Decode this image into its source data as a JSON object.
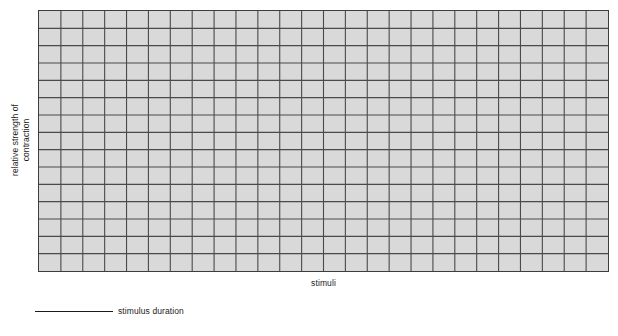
{
  "figure": {
    "title": "",
    "y_axis_label_line1": "relative strength of",
    "y_axis_label_line2": "contraction",
    "x_axis_label": "stimuli",
    "legend": {
      "series_label": "stimulus duration",
      "marker": "solid-line"
    },
    "colors": {
      "page_background": "#ffffff",
      "grid_fill": "#d9d9d9",
      "grid_line": "#4a4a4a",
      "grid_border": "#3d3d3d",
      "text": "#1b1b1b",
      "legend_line": "#1b1b1b"
    }
  },
  "chart_data": {
    "type": "line",
    "title": "",
    "subtitle": "",
    "xlabel": "stimuli",
    "ylabel": "relative strength of contraction",
    "x": [],
    "series": [
      {
        "name": "stimulus duration",
        "values": []
      }
    ],
    "categories": [],
    "values": [],
    "xlim": [
      0,
      26
    ],
    "ylim": [
      0,
      15
    ],
    "xticks": [],
    "yticks": [],
    "xticklabels": [],
    "yticklabels": [],
    "grid": true,
    "grid_columns": 26,
    "grid_rows": 15,
    "legend_position": "below-axes-left",
    "annotations": []
  }
}
